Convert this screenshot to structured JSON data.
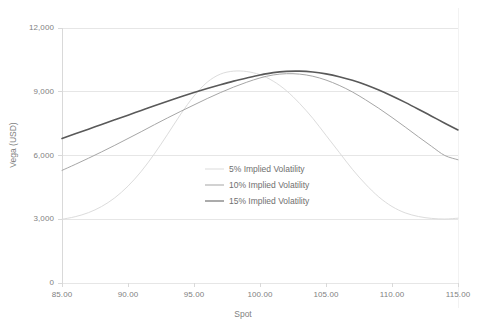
{
  "chart_data": {
    "type": "line",
    "title": "",
    "xlabel": "Spot",
    "ylabel": "Vega (USD)",
    "xlim": [
      85,
      115
    ],
    "ylim": [
      0,
      12000
    ],
    "grid": true,
    "grid_axis": "y",
    "legend_position": "center",
    "xticks": [
      "85.00",
      "90.00",
      "95.00",
      "100.00",
      "105.00",
      "110.00",
      "115.00"
    ],
    "yticks": [
      "0",
      "3,000",
      "6,000",
      "9,000",
      "12,000"
    ],
    "x": [
      85,
      86,
      87,
      88,
      89,
      90,
      91,
      92,
      93,
      94,
      95,
      96,
      97,
      98,
      99,
      100,
      101,
      102,
      103,
      104,
      105,
      106,
      107,
      108,
      109,
      110,
      111,
      112,
      113,
      114,
      115
    ],
    "series": [
      {
        "name": "5% Implied Volatility",
        "color": "#dcdcdc",
        "width": 1,
        "values": [
          3000,
          3120,
          3310,
          3600,
          4010,
          4560,
          5250,
          6080,
          7000,
          7950,
          8800,
          9450,
          9830,
          9970,
          9950,
          9800,
          9500,
          9050,
          8450,
          7750,
          6950,
          6150,
          5350,
          4650,
          4050,
          3600,
          3300,
          3130,
          3040,
          3010,
          3050
        ]
      },
      {
        "name": "10% Implied Volatility",
        "color": "#a6a6a6",
        "width": 1,
        "values": [
          5300,
          5580,
          5870,
          6170,
          6480,
          6800,
          7120,
          7450,
          7770,
          8080,
          8380,
          8680,
          8960,
          9220,
          9450,
          9650,
          9790,
          9850,
          9830,
          9730,
          9550,
          9300,
          8990,
          8620,
          8220,
          7790,
          7340,
          6880,
          6430,
          6000,
          5800
        ]
      },
      {
        "name": "15% Implied Volatility",
        "color": "#595959",
        "width": 1.6,
        "values": [
          6800,
          7020,
          7240,
          7460,
          7680,
          7900,
          8120,
          8340,
          8550,
          8760,
          8960,
          9150,
          9330,
          9500,
          9650,
          9790,
          9900,
          9960,
          9970,
          9930,
          9840,
          9710,
          9540,
          9330,
          9080,
          8800,
          8500,
          8180,
          7850,
          7520,
          7200
        ]
      }
    ]
  },
  "axis": {
    "y_title": "Vega (USD)",
    "x_title": "Spot"
  },
  "caption": {
    "sliver_text": ""
  }
}
